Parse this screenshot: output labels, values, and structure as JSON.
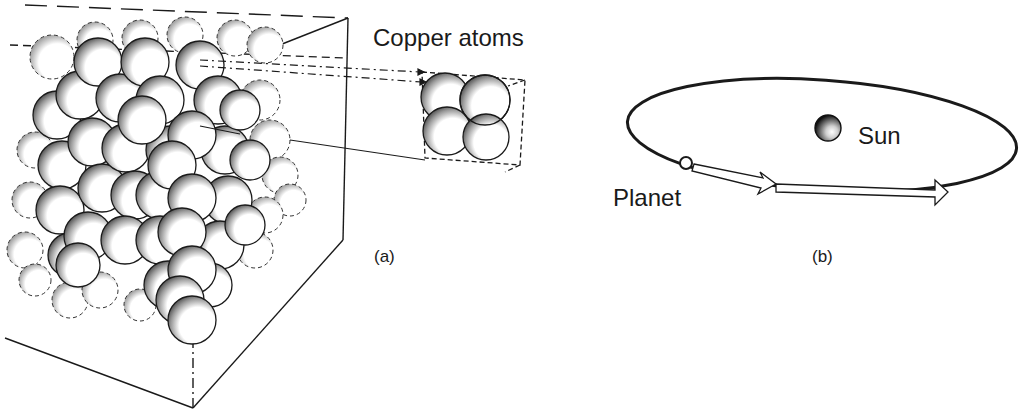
{
  "figure": {
    "panel_a": {
      "title": "Copper atoms",
      "caption": "(a)"
    },
    "panel_b": {
      "sun_label": "Sun",
      "planet_label": "Planet",
      "caption": "(b)"
    }
  },
  "colors": {
    "ink": "#1a1a1a",
    "background": "#ffffff",
    "shade": "#555555"
  }
}
